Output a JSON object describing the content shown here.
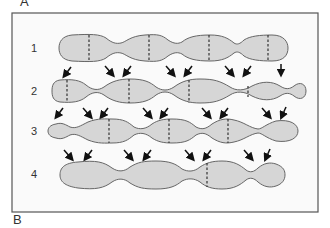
{
  "panels": {
    "top_label": "A",
    "bottom_label": "B"
  },
  "rows": [
    {
      "label": "1",
      "y": 48,
      "dashes": [
        89,
        149,
        209,
        268
      ]
    },
    {
      "label": "2",
      "y": 91,
      "dashes": [
        67,
        129,
        189,
        248
      ]
    },
    {
      "label": "3",
      "y": 131,
      "dashes": [
        109,
        169,
        228
      ]
    },
    {
      "label": "4",
      "y": 174,
      "dashes": [
        207
      ]
    }
  ],
  "colors": {
    "cell_fill": "#d6d6d6",
    "cell_stroke": "#666666",
    "frame": "#555555",
    "arrow": "#111111"
  }
}
